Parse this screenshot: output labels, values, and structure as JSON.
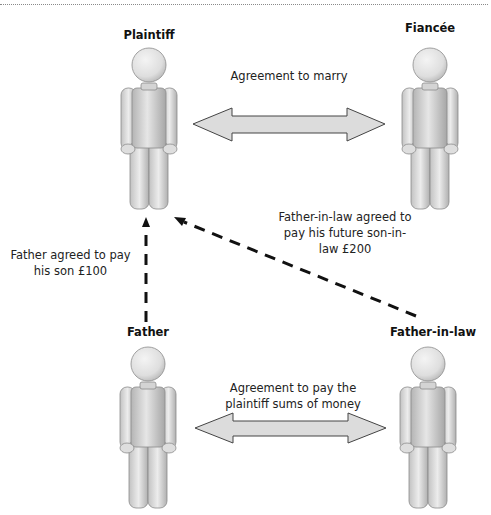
{
  "parties": {
    "plaintiff": "Plaintiff",
    "fiancee": "Fiancée",
    "father": "Father",
    "father_in_law": "Father-in-law"
  },
  "relations": {
    "marriage_agreement": "Agreement to marry",
    "payment_agreement_line1": "Agreement to pay the",
    "payment_agreement_line2": "plaintiff sums of money",
    "father_promise_line1": "Father agreed to pay",
    "father_promise_line2": "his son £100",
    "father_in_law_promise_line1": "Father-in-law agreed to",
    "father_in_law_promise_line2": "pay his future son-in-",
    "father_in_law_promise_line3": "law £200"
  },
  "colors": {
    "figure_fill_light": "#eeeeee",
    "figure_fill_dark": "#a8a8a8",
    "figure_stroke": "#8c8c8c",
    "arrow_fill": "#dcdcdc",
    "arrow_stroke": "#444444",
    "dashed_line": "#111111"
  }
}
